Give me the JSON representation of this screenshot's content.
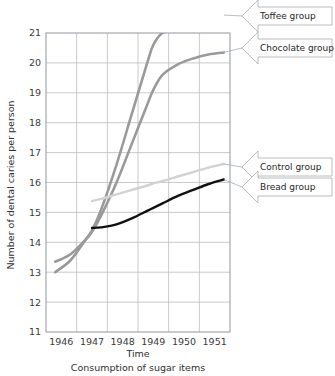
{
  "chart_data": {
    "type": "line",
    "title": "",
    "xlabel": "Time",
    "ylabel": "Number of dental caries per person",
    "caption": "Consumption of sugar items",
    "xlim": [
      1945.5,
      1951.5
    ],
    "ylim": [
      11,
      21
    ],
    "grid": true,
    "legend_position": "right-callouts",
    "x_tick_labels": [
      "1946",
      "1947",
      "1948",
      "1949",
      "1950",
      "1951"
    ],
    "x_tick_values": [
      1946,
      1947,
      1948,
      1949,
      1950,
      1951
    ],
    "y_tick_labels": [
      "11",
      "12",
      "13",
      "14",
      "15",
      "16",
      "17",
      "18",
      "19",
      "20",
      "21"
    ],
    "y_tick_values": [
      11,
      12,
      13,
      14,
      15,
      16,
      17,
      18,
      19,
      20,
      21
    ],
    "x": [
      1945.8,
      1946.3,
      1946.8,
      1947.0,
      1947.3,
      1947.8,
      1948.3,
      1948.8,
      1949.0,
      1949.3,
      1949.8,
      1950.3,
      1950.8,
      1951.3
    ],
    "series": [
      {
        "name": "Toffee group",
        "color": "#9a9a9a",
        "width": 2.6,
        "values": [
          13.0,
          13.4,
          14.1,
          14.4,
          15.1,
          16.6,
          18.3,
          20.0,
          20.6,
          21.0,
          21.1,
          21.25,
          21.4,
          21.6
        ]
      },
      {
        "name": "Chocolate group",
        "color": "#9a9a9a",
        "width": 2.6,
        "values": [
          13.35,
          13.6,
          14.1,
          14.35,
          14.9,
          16.0,
          17.3,
          18.6,
          19.1,
          19.6,
          19.95,
          20.15,
          20.28,
          20.35
        ]
      },
      {
        "name": "Control group",
        "color": "#d2d2d2",
        "width": 2.4,
        "values": [
          null,
          null,
          null,
          15.38,
          15.45,
          15.6,
          15.75,
          15.9,
          15.97,
          16.05,
          16.2,
          16.35,
          16.5,
          16.62
        ]
      },
      {
        "name": "Bread group",
        "color": "#111111",
        "width": 2.4,
        "values": [
          null,
          null,
          null,
          14.48,
          14.5,
          14.6,
          14.8,
          15.05,
          15.15,
          15.3,
          15.55,
          15.75,
          15.95,
          16.1
        ]
      }
    ],
    "callouts": [
      {
        "label": "Toffee group",
        "target_series": "Toffee group"
      },
      {
        "label": "Chocolate group",
        "target_series": "Chocolate group"
      },
      {
        "label": "Control group",
        "target_series": "Control group"
      },
      {
        "label": "Bread group",
        "target_series": "Bread group"
      }
    ]
  }
}
